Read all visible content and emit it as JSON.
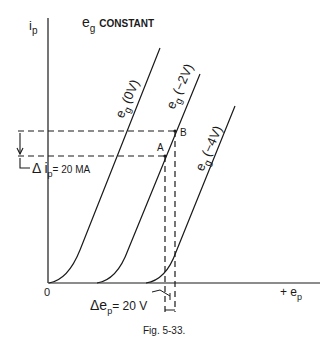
{
  "diagram": {
    "y_axis_label": "i",
    "y_axis_sub": "p",
    "title_main": "e",
    "title_sub": "g",
    "title_rest": "CONSTANT",
    "origin_label": "0",
    "x_axis_label_prefix": "+ e",
    "x_axis_label_sub": "p",
    "curves": [
      {
        "main": "e",
        "sub": "g",
        "value": "(0V)"
      },
      {
        "main": "e",
        "sub": "g",
        "value": "(−2V)"
      },
      {
        "main": "e",
        "sub": "g",
        "value": "(−4V)"
      }
    ],
    "point_a": "A",
    "point_b": "B",
    "delta_ip": {
      "prefix": "Δ i",
      "sub": "p",
      "value": "= 20 MA"
    },
    "delta_ep": {
      "prefix": "Δe",
      "sub": "p",
      "value": "= 20 V"
    },
    "caption": "Fig. 5-33."
  }
}
